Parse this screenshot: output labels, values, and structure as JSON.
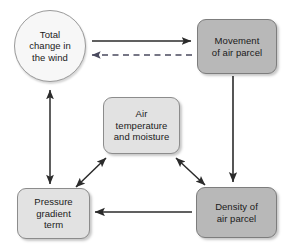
{
  "diagram": {
    "background_color": "#ffffff",
    "stroke_color": "#2b2b2b",
    "fill_dark": "#b8b8b8",
    "fill_light": "#e2e2e2",
    "fill_circle": "#f7f7f7"
  },
  "nodes": [
    {
      "id": "total-change",
      "label": "Total\nchange in\nthe wind",
      "shape": "circle",
      "fill": "#f7f7f7"
    },
    {
      "id": "movement",
      "label": "Movement\nof air parcel",
      "shape": "rounded-rect",
      "fill": "#b8b8b8"
    },
    {
      "id": "air-temperature",
      "label": "Air\ntemperature\nand moisture",
      "shape": "rounded-rect",
      "fill": "#e2e2e2"
    },
    {
      "id": "pressure-gradient",
      "label": "Pressure\ngradient\nterm",
      "shape": "rounded-rect",
      "fill": "#e2e2e2"
    },
    {
      "id": "density",
      "label": "Density of\nair parcel",
      "shape": "rounded-rect",
      "fill": "#b8b8b8"
    }
  ],
  "edges": [
    {
      "id": "total-change-to-movement",
      "from": "total-change",
      "to": "movement",
      "style": "solid",
      "arrowheads": "end",
      "direction": "right"
    },
    {
      "id": "movement-to-total-change",
      "from": "movement",
      "to": "total-change",
      "style": "dashed",
      "arrowheads": "end",
      "direction": "left"
    },
    {
      "id": "movement-to-density",
      "from": "movement",
      "to": "density",
      "style": "solid",
      "arrowheads": "end",
      "direction": "down"
    },
    {
      "id": "density-to-pressure-gradient",
      "from": "density",
      "to": "pressure-gradient",
      "style": "solid",
      "arrowheads": "end",
      "direction": "left"
    },
    {
      "id": "pressure-gradient-total-change",
      "from": "pressure-gradient",
      "to": "total-change",
      "style": "solid",
      "arrowheads": "both",
      "direction": "vertical"
    },
    {
      "id": "pressure-gradient-air-temperature",
      "from": "pressure-gradient",
      "to": "air-temperature",
      "style": "solid",
      "arrowheads": "both",
      "direction": "diagonal-up-right"
    },
    {
      "id": "density-air-temperature",
      "from": "density",
      "to": "air-temperature",
      "style": "solid",
      "arrowheads": "both",
      "direction": "diagonal-up-left"
    }
  ]
}
